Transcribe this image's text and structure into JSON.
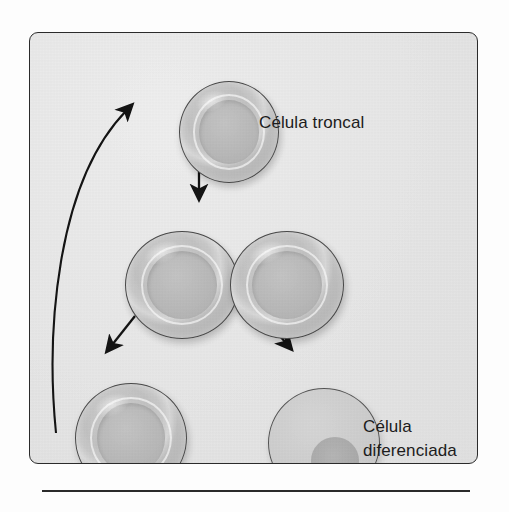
{
  "figure": {
    "panel": {
      "background_color": "#e6e6e6",
      "border_color": "#2b2b2b"
    },
    "bottom_rule_color": "#2a2a2a"
  },
  "labels": {
    "stem_cell": "Célula troncal",
    "differentiated_cell_line1": "Célula",
    "differentiated_cell_line2": "diferenciada"
  },
  "cells": [
    {
      "id": "stem-top",
      "type": "stem",
      "label": "Célula troncal",
      "description": "célula troncal con halo claro y núcleo central"
    },
    {
      "id": "division-left",
      "type": "stem",
      "label": "",
      "description": "célula hija izquierda en división"
    },
    {
      "id": "division-right",
      "type": "stem",
      "label": "",
      "description": "célula hija derecha en división"
    },
    {
      "id": "stem-bottom",
      "type": "stem",
      "label": "",
      "description": "célula troncal resultante, se autorrenueva"
    },
    {
      "id": "differentiated",
      "type": "differentiated",
      "label": "Célula diferenciada",
      "description": "célula diferenciada con núcleo pequeño desplazado"
    }
  ],
  "arrows": [
    {
      "id": "divide-arrow",
      "shape": "straight",
      "direction": "down",
      "from": "stem-top",
      "to": "division-pair"
    },
    {
      "id": "daughter-left-arrow",
      "shape": "straight",
      "direction": "down-left",
      "from": "division-left",
      "to": "stem-bottom"
    },
    {
      "id": "daughter-right-arrow",
      "shape": "straight",
      "direction": "down-right",
      "from": "division-right",
      "to": "differentiated"
    },
    {
      "id": "self-renewal-arrow",
      "shape": "curved",
      "direction": "up",
      "from": "stem-bottom",
      "to": "stem-top"
    }
  ],
  "colors": {
    "ink": "#1d1d1d",
    "cell_fill": "#c4c4c4",
    "cell_outline": "#4a4a4a",
    "differentiated_fill": "#cecece",
    "panel_fill": "#e6e6e6"
  }
}
